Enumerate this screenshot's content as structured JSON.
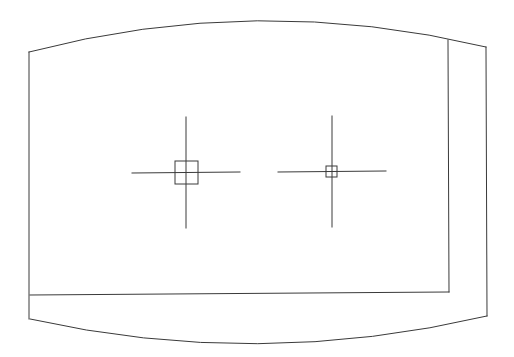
{
  "drawing": {
    "width": 514,
    "height": 357,
    "background": "#ffffff",
    "stroke_color": "#3a3a3a",
    "stroke_width": 1,
    "outline": {
      "top_arc": {
        "start": [
          29,
          52
        ],
        "control": [
          257,
          -8
        ],
        "end": [
          486,
          47
        ]
      },
      "bottom_arc": {
        "start": [
          30,
          319
        ],
        "control": [
          257,
          370
        ],
        "end": [
          487,
          316
        ]
      },
      "left_edge": {
        "x": 29,
        "y1": 52,
        "y2": 319
      },
      "right_edge": {
        "x": 486,
        "y1": 47,
        "y2": 316
      }
    },
    "inner_frame": {
      "right_x": 448,
      "top_y": 40,
      "bottom_y": 292,
      "bottom_left": [
        30,
        295
      ]
    },
    "markers": [
      {
        "name": "crosshair-large",
        "center": [
          186,
          173
        ],
        "h_span": [
          132,
          240
        ],
        "v_span": [
          117,
          228
        ],
        "box": {
          "x": 175,
          "y": 161,
          "size": 23
        }
      },
      {
        "name": "crosshair-small",
        "center": [
          332,
          172
        ],
        "h_span": [
          278,
          386
        ],
        "v_span": [
          116,
          227
        ],
        "box": {
          "x": 326,
          "y": 166,
          "size": 11
        }
      }
    ]
  }
}
